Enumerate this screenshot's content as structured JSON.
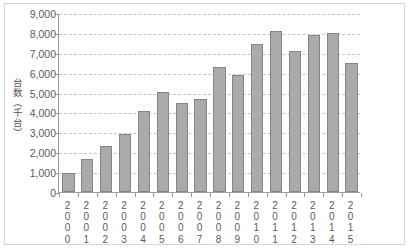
{
  "chart_data": {
    "type": "bar",
    "title": "",
    "xlabel": "",
    "ylabel": "台数（千台）",
    "ylim": [
      0,
      9000
    ],
    "ytick_step": 1000,
    "grid": true,
    "legend": false,
    "categories": [
      "2000",
      "2001",
      "2002",
      "2003",
      "2004",
      "2005",
      "2006",
      "2007",
      "2008",
      "2009",
      "2010",
      "2011",
      "2012",
      "2013",
      "2014",
      "2015"
    ],
    "values": [
      950,
      1650,
      2300,
      2900,
      4050,
      5050,
      4500,
      4700,
      6300,
      5900,
      7450,
      8100,
      7100,
      7900,
      8000,
      6500
    ],
    "ytick_labels": [
      "9,000",
      "8,000",
      "7,000",
      "6,000",
      "5,000",
      "4,000",
      "3,000",
      "2,000",
      "1,000",
      "0"
    ],
    "ytick_values": [
      9000,
      8000,
      7000,
      6000,
      5000,
      4000,
      3000,
      2000,
      1000,
      0
    ],
    "colors": {
      "bar_fill": "#aaaaaa",
      "bar_border": "#858585",
      "gridline": "#c4c4c4",
      "axis": "#9a9a9a",
      "text": "#5a5a5a",
      "frame": "#d8d8d8",
      "background": "#ffffff"
    }
  }
}
